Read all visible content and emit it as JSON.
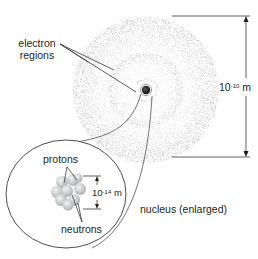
{
  "labels": {
    "electron_regions_line1": "electron",
    "electron_regions_line2": "regions",
    "atom_size_base": "10",
    "atom_size_exp": "-10",
    "atom_size_unit": " m",
    "protons": "protons",
    "neutrons": "neutrons",
    "nucleus_size_base": "10",
    "nucleus_size_exp": "-14",
    "nucleus_size_unit": " m",
    "nucleus_caption": "nucleus (enlarged)"
  },
  "colors": {
    "line": "#3a3a3a",
    "cloud": "#9a9a9a",
    "nucleus_dot": "#222222",
    "particle": "#c8cacb"
  }
}
